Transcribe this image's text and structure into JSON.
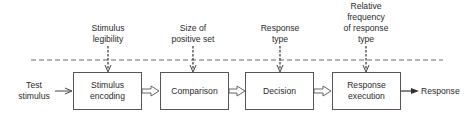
{
  "diagram": {
    "input_label": [
      "Test",
      "stimulus"
    ],
    "output_label": "Response",
    "stages": [
      {
        "label": [
          "Stimulus",
          "encoding"
        ],
        "factor": [
          "Stimulus",
          "legibility"
        ]
      },
      {
        "label": [
          "Comparison"
        ],
        "factor": [
          "Size of",
          "positive set"
        ]
      },
      {
        "label": [
          "Decision"
        ],
        "factor": [
          "Response",
          "type"
        ]
      },
      {
        "label": [
          "Response",
          "execution"
        ],
        "factor": [
          "Relative",
          "frequency",
          "of response",
          "type"
        ]
      }
    ],
    "colors": {
      "stroke": "#555555",
      "text": "#2a2a2a",
      "background": "#ffffff"
    }
  }
}
